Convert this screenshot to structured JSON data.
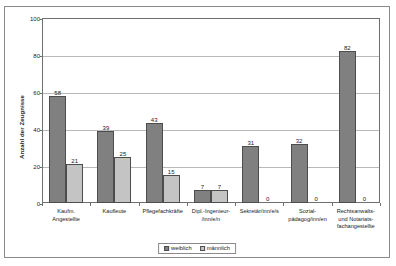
{
  "chart_data": {
    "type": "bar",
    "title": "",
    "xlabel": "",
    "ylabel": "Anzahl der Zeugnisse",
    "ylim": [
      0,
      100
    ],
    "yticks": [
      0,
      20,
      40,
      60,
      80,
      100
    ],
    "grid": true,
    "legend_position": "bottom",
    "categories": [
      "Kaufm. Angestellte",
      "Kaufleute",
      "Pflegefachkräfte",
      "Dipl.-Ingenieur-/inn/e/n",
      "Sekretär/inn/e/s",
      "Sozialpädagog/inn/en",
      "Rechtsanwalts- und Notariatsfachangestellte"
    ],
    "category_lines": [
      [
        "Kaufm.",
        "Angestellte"
      ],
      [
        "Kaufleute"
      ],
      [
        "Pflegefachkräfte"
      ],
      [
        "Dipl.-Ingenieur-",
        "/inn/e/n"
      ],
      [
        "Sekretär/inn/e/s"
      ],
      [
        "Sozial-",
        "pädagog/inn/en"
      ],
      [
        "Rechtsanwalts-",
        "und Notariats-",
        "fachangestellte"
      ]
    ],
    "series": [
      {
        "name": "weiblich",
        "color": "#808080",
        "values": [
          58,
          39,
          43,
          7,
          31,
          32,
          82
        ]
      },
      {
        "name": "männlich",
        "color": "#c4c4c4",
        "values": [
          21,
          25,
          15,
          7,
          0,
          0,
          0
        ]
      }
    ]
  },
  "legend": {
    "items": [
      {
        "label": "weiblich"
      },
      {
        "label": "männlich"
      }
    ]
  }
}
